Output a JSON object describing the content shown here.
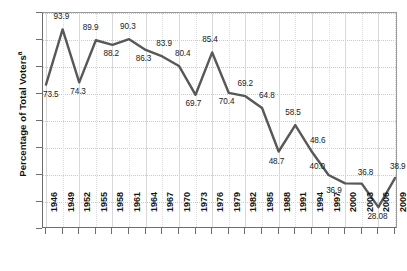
{
  "chart_data": {
    "type": "line",
    "title": "",
    "xlabel": "",
    "ylabel": "Percentage of Total Voters",
    "ylabel_superscript": "a",
    "ylim": [
      20,
      100
    ],
    "yticks": [
      100,
      90,
      80,
      70,
      60,
      50,
      40,
      30,
      20
    ],
    "grid": true,
    "legend": "none",
    "categories": [
      "1946",
      "1949",
      "1952",
      "1955",
      "1958",
      "1961",
      "1964",
      "1967",
      "1970",
      "1973",
      "1976",
      "1979",
      "1982",
      "1985",
      "1988",
      "1991",
      "1994",
      "1997",
      "2000",
      "2003",
      "2006",
      "2009"
    ],
    "values": [
      73.5,
      93.9,
      74.3,
      89.9,
      88.2,
      90.3,
      86.3,
      83.9,
      80.4,
      69.7,
      85.4,
      70.4,
      69.2,
      64.8,
      48.7,
      58.5,
      48.6,
      40.0,
      36.9,
      36.8,
      28.08,
      38.9
    ],
    "value_labels": [
      "73.5",
      "93.9",
      "74.3",
      "89.9",
      "88.2",
      "90.3",
      "86.3",
      "83.9",
      "80.4",
      "69.7",
      "85.4",
      "70.4",
      "69.2",
      "64.8",
      "48.7",
      "58.5",
      "48.6",
      "40.0",
      "36.9",
      "36.8",
      "28.08",
      "38.9"
    ],
    "label_offsets": [
      {
        "dx": -2,
        "dy": 10
      },
      {
        "dx": -8,
        "dy": -12
      },
      {
        "dx": -8,
        "dy": 10
      },
      {
        "dx": -12,
        "dy": -12
      },
      {
        "dx": -8,
        "dy": 9
      },
      {
        "dx": -8,
        "dy": -12
      },
      {
        "dx": -9,
        "dy": 9
      },
      {
        "dx": -5,
        "dy": -12
      },
      {
        "dx": -3,
        "dy": -12
      },
      {
        "dx": -9,
        "dy": 9
      },
      {
        "dx": -9,
        "dy": -12
      },
      {
        "dx": -9,
        "dy": 9
      },
      {
        "dx": -7,
        "dy": -12
      },
      {
        "dx": -2,
        "dy": -12
      },
      {
        "dx": -9,
        "dy": 10
      },
      {
        "dx": -9,
        "dy": -12
      },
      {
        "dx": -1,
        "dy": -11
      },
      {
        "dx": -18,
        "dy": -8
      },
      {
        "dx": -18,
        "dy": 8
      },
      {
        "dx": -3,
        "dy": -11
      },
      {
        "dx": -10,
        "dy": 10
      },
      {
        "dx": -4,
        "dy": -11
      }
    ],
    "colors": {
      "line": "#585858",
      "axis": "#6d6d6d",
      "grid": "#d5d5d5",
      "text": "#111111",
      "background": "#ffffff"
    },
    "line_width": 2.4
  }
}
